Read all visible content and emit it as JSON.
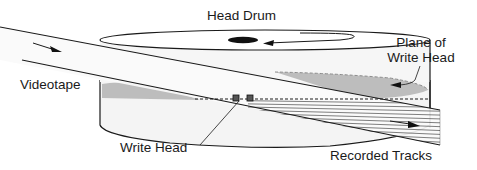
{
  "diagram": {
    "labels": {
      "head_drum": "Head Drum",
      "plane_of_write_head_line1": "Plane of",
      "plane_of_write_head_line2": "Write Head",
      "videotape": "Videotape",
      "write_head": "Write Head",
      "recorded_tracks": "Recorded Tracks"
    },
    "colors": {
      "line": "#1a1a1a",
      "drum_fill": "#f3f3f3",
      "shade": "#b8b8b8",
      "tape_fill": "#f7f7f7"
    }
  }
}
